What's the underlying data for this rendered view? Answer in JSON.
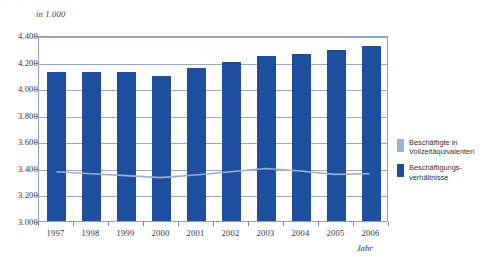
{
  "top_clip_text": "·   ·   ·   ·",
  "unit_label": "in 1.000",
  "axes": {
    "y_ticks": [
      "4.400",
      "4.200",
      "4.000",
      "3.800",
      "3.600",
      "3.400",
      "3.200",
      "3.000"
    ],
    "y_values": [
      4400,
      4200,
      4000,
      3800,
      3600,
      3400,
      3200,
      3000
    ],
    "x_title": "Jahr"
  },
  "legend": {
    "position": "right",
    "items": [
      {
        "label": "Beschäftigte in\nVollzeitäquivalenten",
        "color": "#9daed8",
        "swatch_name": "legend-swatch-vollzeitaequivalente"
      },
      {
        "label": "Beschäftigungs-\nverhältnisse",
        "color": "#1d4f9e",
        "swatch_name": "legend-swatch-beschaeftigungsverhaeltnisse"
      }
    ]
  },
  "colors": {
    "bar": "#1d4f9e",
    "line": "#9daed8",
    "grid": "#9aa6cd",
    "frame": "#8e9bc4",
    "background": "#ffffff",
    "text": "#33333d"
  },
  "chart_data": {
    "type": "bar",
    "title": "",
    "subtitle": "",
    "xlabel": "Jahr",
    "ylabel": "in 1.000",
    "ylim": [
      3000,
      4400
    ],
    "ytick_step": 200,
    "grid": true,
    "legend_position": "right",
    "categories": [
      "1997",
      "1998",
      "1999",
      "2000",
      "2001",
      "2002",
      "2003",
      "2004",
      "2005",
      "2006"
    ],
    "series": [
      {
        "name": "Beschäftigungsverhältnisse",
        "type": "bar",
        "color": "#1d4f9e",
        "values": [
          4125,
          4125,
          4120,
          4090,
          4150,
          4200,
          4245,
          4260,
          4290,
          4320
        ]
      },
      {
        "name": "Beschäftigte in Vollzeitäquivalenten",
        "type": "line",
        "color": "#9daed8",
        "values": [
          3375,
          3360,
          3345,
          3330,
          3350,
          3375,
          3400,
          3380,
          3355,
          3360
        ]
      }
    ]
  }
}
